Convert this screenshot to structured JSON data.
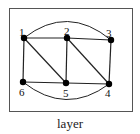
{
  "figure": {
    "caption": "layer",
    "nodes": [
      {
        "id": "1",
        "label": "1",
        "x": 24,
        "y": 38,
        "lx": 19,
        "ly": 36
      },
      {
        "id": "2",
        "label": "2",
        "x": 67,
        "y": 38,
        "lx": 64,
        "ly": 35
      },
      {
        "id": "3",
        "label": "3",
        "x": 111,
        "y": 40,
        "lx": 106,
        "ly": 37
      },
      {
        "id": "4",
        "label": "4",
        "x": 109,
        "y": 84,
        "lx": 105,
        "ly": 97
      },
      {
        "id": "5",
        "label": "5",
        "x": 66,
        "y": 83,
        "lx": 63,
        "ly": 97
      },
      {
        "id": "6",
        "label": "6",
        "x": 23,
        "y": 82,
        "lx": 19,
        "ly": 96
      }
    ],
    "edges": [
      [
        "1",
        "2"
      ],
      [
        "2",
        "3"
      ],
      [
        "3",
        "4"
      ],
      [
        "4",
        "5"
      ],
      [
        "5",
        "6"
      ],
      [
        "6",
        "1"
      ],
      [
        "1",
        "5"
      ],
      [
        "2",
        "5"
      ],
      [
        "2",
        "4"
      ]
    ],
    "arcs": [
      {
        "from": "1",
        "to": "3",
        "side": "top"
      },
      {
        "from": "6",
        "to": "4",
        "side": "bottom"
      }
    ]
  }
}
